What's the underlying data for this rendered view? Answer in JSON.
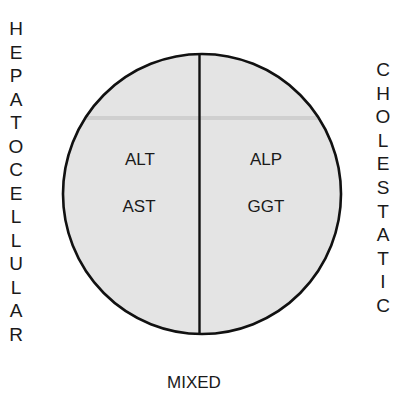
{
  "diagram": {
    "type": "liver-injury-pattern",
    "shape": "ellipse-split-vertically",
    "fill_color": "#e4e4e4",
    "stroke_color": "#111111",
    "left_axis_label": "HEPATOCELLULAR",
    "left_axis_letters": [
      "H",
      "E",
      "P",
      "A",
      "T",
      "O",
      "C",
      "E",
      "L",
      "L",
      "U",
      "L",
      "A",
      "R"
    ],
    "right_axis_label": "CHOLESTATIC",
    "right_axis_letters": [
      "C",
      "H",
      "O",
      "L",
      "E",
      "S",
      "T",
      "A",
      "T",
      "I",
      "C"
    ],
    "bottom_label": "MIXED",
    "left_half": {
      "markers": [
        "ALT",
        "AST"
      ]
    },
    "right_half": {
      "markers": [
        "ALP",
        "GGT"
      ]
    }
  }
}
